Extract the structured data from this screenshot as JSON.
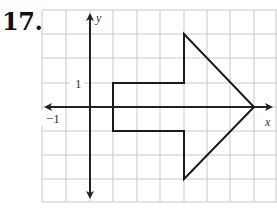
{
  "problem": {
    "number": "17."
  },
  "graph": {
    "x_axis_label": "x",
    "y_axis_label": "y",
    "tick_labels": {
      "y_one": "1",
      "x_neg_one": "−1"
    },
    "grid": {
      "x_min": -2,
      "x_max": 8,
      "y_min": -4,
      "y_max": 4,
      "step": 1
    },
    "shape": {
      "type": "arrow",
      "vertices": [
        [
          1,
          1
        ],
        [
          4,
          1
        ],
        [
          4,
          3
        ],
        [
          7,
          0
        ],
        [
          4,
          -3
        ],
        [
          4,
          -1
        ],
        [
          1,
          -1
        ]
      ]
    },
    "colors": {
      "grid": "#c8c8c8",
      "axis": "#222222",
      "shape": "#1a1a1a"
    }
  }
}
